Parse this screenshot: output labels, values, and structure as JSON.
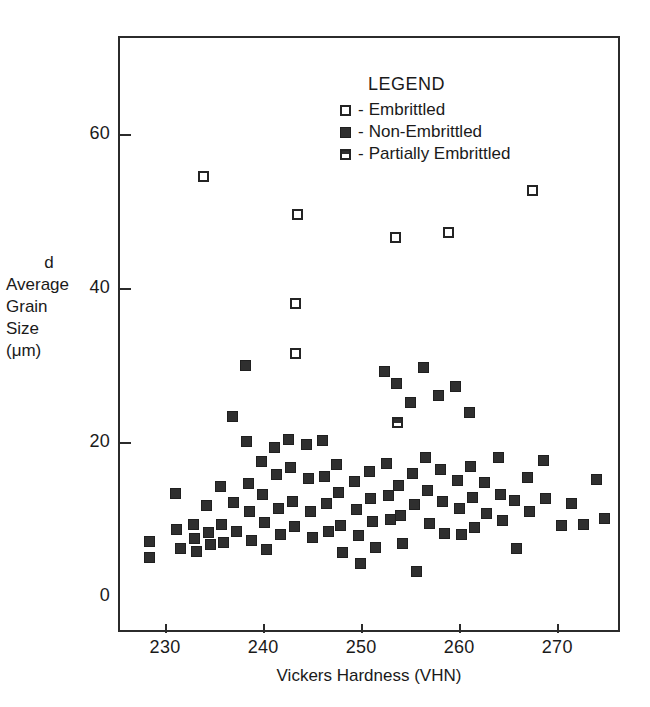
{
  "chart_data": {
    "type": "scatter",
    "title": "",
    "xlabel": "Vickers Hardness (VHN)",
    "ylabel_lines": [
      "d",
      "Average",
      "Grain",
      "Size",
      "(μm)"
    ],
    "xlim": [
      225.2,
      276.4
    ],
    "ylim": [
      -4.7,
      72.7
    ],
    "xticks": [
      230,
      240,
      250,
      260,
      270
    ],
    "yticks": [
      0,
      20,
      40,
      60
    ],
    "grid": false,
    "legend_position": "upper-center",
    "legend_title": "LEGEND",
    "series": [
      {
        "name": "Embrittled",
        "marker": "open-square",
        "legend_dash": "-",
        "points": [
          [
            233.9,
            54.5
          ],
          [
            243.5,
            49.5
          ],
          [
            253.5,
            46.5
          ],
          [
            258.9,
            47.2
          ],
          [
            267.5,
            52.6
          ],
          [
            243.3,
            38.0
          ],
          [
            243.3,
            31.5
          ]
        ]
      },
      {
        "name": "Non-Embrittled",
        "marker": "filled-square",
        "legend_dash": "-",
        "points": [
          [
            228.4,
            7.0
          ],
          [
            228.4,
            5.0
          ],
          [
            231.1,
            13.3
          ],
          [
            231.2,
            8.6
          ],
          [
            231.6,
            6.1
          ],
          [
            232.9,
            9.3
          ],
          [
            233.0,
            7.4
          ],
          [
            233.2,
            5.7
          ],
          [
            234.2,
            11.7
          ],
          [
            234.4,
            8.2
          ],
          [
            234.6,
            6.6
          ],
          [
            235.7,
            14.2
          ],
          [
            235.8,
            9.2
          ],
          [
            236.0,
            6.9
          ],
          [
            236.9,
            23.3
          ],
          [
            237.0,
            12.1
          ],
          [
            237.3,
            8.3
          ],
          [
            238.2,
            29.9
          ],
          [
            238.3,
            20.0
          ],
          [
            238.5,
            14.6
          ],
          [
            238.6,
            10.9
          ],
          [
            238.8,
            7.2
          ],
          [
            239.8,
            17.4
          ],
          [
            239.9,
            13.1
          ],
          [
            240.1,
            9.5
          ],
          [
            240.3,
            6.0
          ],
          [
            241.2,
            19.3
          ],
          [
            241.4,
            15.7
          ],
          [
            241.6,
            11.3
          ],
          [
            241.8,
            8.0
          ],
          [
            242.6,
            20.3
          ],
          [
            242.8,
            16.6
          ],
          [
            243.0,
            12.3
          ],
          [
            243.2,
            9.0
          ],
          [
            244.4,
            19.6
          ],
          [
            244.6,
            15.2
          ],
          [
            244.8,
            11.0
          ],
          [
            245.0,
            7.6
          ],
          [
            246.1,
            20.2
          ],
          [
            246.3,
            15.5
          ],
          [
            246.5,
            12.0
          ],
          [
            246.7,
            8.4
          ],
          [
            247.5,
            17.0
          ],
          [
            247.7,
            13.4
          ],
          [
            247.9,
            9.1
          ],
          [
            248.1,
            5.6
          ],
          [
            249.3,
            14.9
          ],
          [
            249.5,
            11.2
          ],
          [
            249.7,
            7.8
          ],
          [
            249.9,
            4.2
          ],
          [
            250.8,
            16.1
          ],
          [
            251.0,
            12.6
          ],
          [
            251.2,
            9.6
          ],
          [
            251.5,
            6.3
          ],
          [
            252.4,
            29.1
          ],
          [
            252.6,
            17.2
          ],
          [
            252.8,
            13.0
          ],
          [
            253.0,
            9.9
          ],
          [
            253.6,
            27.6
          ],
          [
            253.8,
            14.3
          ],
          [
            254.0,
            10.4
          ],
          [
            254.2,
            6.8
          ],
          [
            255.0,
            25.1
          ],
          [
            255.2,
            15.9
          ],
          [
            255.4,
            11.8
          ],
          [
            255.6,
            3.2
          ],
          [
            256.4,
            29.6
          ],
          [
            256.6,
            18.0
          ],
          [
            256.8,
            13.7
          ],
          [
            257.0,
            9.4
          ],
          [
            257.9,
            26.0
          ],
          [
            258.1,
            16.4
          ],
          [
            258.3,
            12.2
          ],
          [
            258.5,
            8.1
          ],
          [
            259.6,
            27.2
          ],
          [
            259.8,
            15.0
          ],
          [
            260.0,
            11.4
          ],
          [
            260.2,
            7.9
          ],
          [
            261.0,
            23.8
          ],
          [
            261.2,
            16.8
          ],
          [
            261.4,
            12.8
          ],
          [
            261.6,
            8.9
          ],
          [
            262.6,
            14.7
          ],
          [
            262.8,
            10.7
          ],
          [
            264.0,
            17.9
          ],
          [
            264.2,
            13.2
          ],
          [
            264.4,
            9.8
          ],
          [
            265.6,
            12.4
          ],
          [
            265.8,
            6.2
          ],
          [
            267.0,
            15.3
          ],
          [
            267.2,
            11.0
          ],
          [
            268.6,
            17.6
          ],
          [
            268.8,
            12.7
          ],
          [
            270.4,
            9.1
          ],
          [
            271.5,
            12.0
          ],
          [
            272.7,
            9.3
          ],
          [
            274.0,
            15.1
          ],
          [
            274.8,
            10.0
          ]
        ]
      },
      {
        "name": "Partially Embrittled",
        "marker": "half-filled-square",
        "legend_dash": "-",
        "points": [
          [
            253.7,
            22.5
          ]
        ]
      }
    ]
  },
  "axis": {
    "x_tick_labels": [
      "230",
      "240",
      "250",
      "260",
      "270"
    ],
    "y_tick_labels": [
      "0",
      "20",
      "40",
      "60"
    ],
    "x_title": "Vickers Hardness (VHN)",
    "y_title_lines": [
      "d",
      "Average",
      "Grain",
      "Size",
      "(μm)"
    ]
  },
  "legend": {
    "title": "LEGEND",
    "entries": [
      {
        "dash": "-",
        "label": "Embrittled",
        "marker": "open-square"
      },
      {
        "dash": "-",
        "label": "Non-Embrittled",
        "marker": "filled-square"
      },
      {
        "dash": "-",
        "label": "Partially Embrittled",
        "marker": "half-filled-square"
      }
    ]
  },
  "colors": {
    "axis": "#2b2b2b",
    "marker_fill": "#2f2f2f",
    "marker_edge": "#242424",
    "background": "#ffffff"
  }
}
